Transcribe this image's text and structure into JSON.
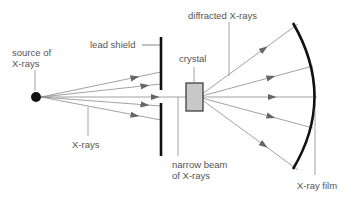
{
  "labels": {
    "source": [
      "source of",
      "X-rays"
    ],
    "lead_shield": "lead shield",
    "crystal": "crystal",
    "diffracted": "diffracted X-rays",
    "xrays": "X-rays",
    "narrow_beam": [
      "narrow beam",
      "of X-rays"
    ],
    "film": "X-ray film"
  },
  "colors": {
    "ray": "#8a8a8a",
    "arrow": "#666666",
    "shield": "#111111",
    "crystal_fill": "#c8c8c8",
    "crystal_stroke": "#333333",
    "text": "#555555"
  }
}
